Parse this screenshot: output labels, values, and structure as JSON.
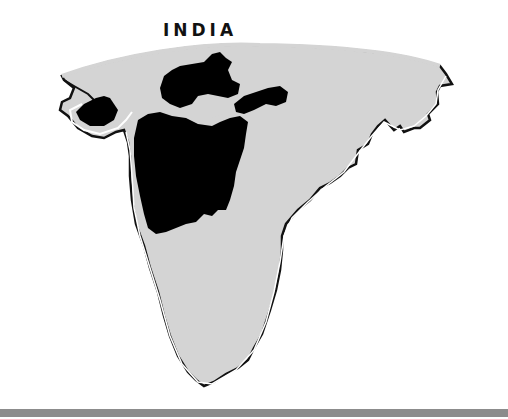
{
  "map": {
    "title": "INDIA",
    "colors": {
      "land": "#d4d4d4",
      "highlight_region": "#000000",
      "coastline": "#111111",
      "background": "#ffffff",
      "bottom_bar": "#8c8c8c"
    },
    "legend": []
  }
}
